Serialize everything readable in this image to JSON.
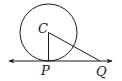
{
  "diagram": {
    "type": "geometry",
    "stroke_color": "#1a1a1a",
    "background": "#ffffff",
    "circle": {
      "center_label": "C",
      "cx": 48.5,
      "cy": 32.5,
      "r": 28.5
    },
    "tangent_line": {
      "x1": 9,
      "y1": 61,
      "x2": 112,
      "y2": 61,
      "arrows": "both"
    },
    "points": [
      {
        "id": "C",
        "label": "C",
        "x": 48.5,
        "y": 32.5,
        "label_x": 38,
        "label_y": 33
      },
      {
        "id": "P",
        "label": "P",
        "x": 48.5,
        "y": 61,
        "label_x": 41,
        "label_y": 75
      },
      {
        "id": "Q",
        "label": "Q",
        "x": 100,
        "y": 61,
        "label_x": 96,
        "label_y": 76
      }
    ],
    "segments": [
      {
        "from": "C",
        "to": "P",
        "name": "radius-CP"
      },
      {
        "from": "C",
        "to": "Q",
        "name": "segment-CQ"
      }
    ]
  }
}
